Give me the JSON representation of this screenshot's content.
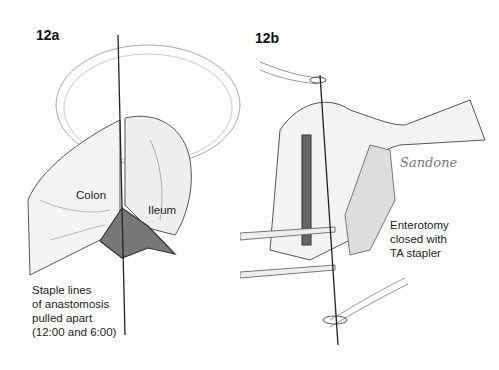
{
  "figure": {
    "panel_a": {
      "label": "12a",
      "annotations": {
        "colon": "Colon",
        "ileum": "Ileum",
        "staple_lines": [
          "Staple lines",
          "of anastomosis",
          "pulled apart",
          "(12:00 and 6:00)"
        ]
      }
    },
    "panel_b": {
      "label": "12b",
      "signature": "Sandone",
      "annotations": {
        "enterotomy": [
          "Enterotomy",
          "closed with",
          "TA stapler"
        ]
      }
    }
  },
  "colors": {
    "ink": "#222222",
    "shade": "#888888",
    "background": "#ffffff"
  }
}
